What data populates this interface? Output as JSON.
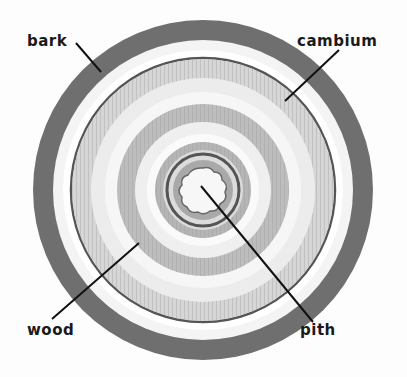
{
  "diagram": {
    "labels": {
      "bark": "bark",
      "cambium": "cambium",
      "wood": "wood",
      "pith": "pith"
    },
    "colors": {
      "bark": "#6e6e6e",
      "cambium_band": "#f2f2f2",
      "wood_ring": "#bdbdbd",
      "wood_light": "#e6e6e6",
      "pith": "#f7f7f7",
      "leader": "#111111"
    }
  }
}
